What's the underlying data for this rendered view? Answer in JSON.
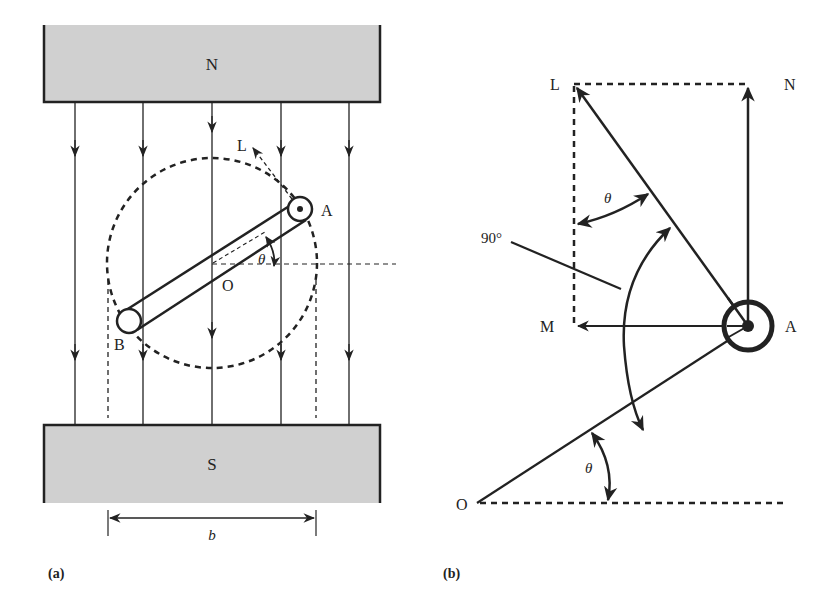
{
  "panel_a": {
    "caption": "(a)",
    "magnet_top_label": "N",
    "magnet_bottom_label": "S",
    "point_a": "A",
    "point_b": "B",
    "point_o": "O",
    "point_l": "L",
    "angle_label": "θ",
    "dimension_label": "b",
    "colors": {
      "magnet_fill": "#d0d0d0",
      "stroke": "#222222"
    }
  },
  "panel_b": {
    "caption": "(b)",
    "point_l": "L",
    "point_n": "N",
    "point_m": "M",
    "point_a": "A",
    "point_o": "O",
    "angle_top": "θ",
    "angle_bottom": "θ",
    "right_angle_label": "90°"
  }
}
